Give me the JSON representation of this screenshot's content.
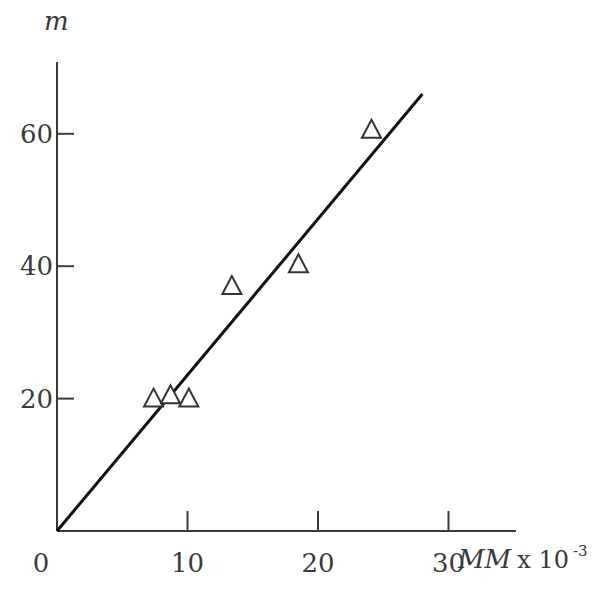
{
  "chart_data": {
    "type": "scatter",
    "title": "",
    "xlabel": "MM x 10^-3",
    "xlabel_main": "MM",
    "xlabel_suffix": "x 10",
    "xlabel_exp": "-3",
    "ylabel": "m",
    "xlim": [
      0,
      35
    ],
    "ylim": [
      0,
      70
    ],
    "x_ticks": [
      0,
      10,
      20,
      30
    ],
    "x_tick_labels": [
      "0",
      "10",
      "20",
      "30"
    ],
    "y_ticks": [
      20,
      40,
      60
    ],
    "y_tick_labels": [
      "20",
      "40",
      "60"
    ],
    "grid": false,
    "legend": null,
    "marker": "open-triangle",
    "series": [
      {
        "name": "data",
        "points": [
          {
            "x": 7.4,
            "y": 20
          },
          {
            "x": 8.7,
            "y": 20.5
          },
          {
            "x": 10.1,
            "y": 20
          },
          {
            "x": 13.4,
            "y": 37
          },
          {
            "x": 18.5,
            "y": 40.3
          },
          {
            "x": 24.1,
            "y": 60.6
          }
        ]
      }
    ],
    "fit_line": {
      "x0": 0,
      "y0": 0,
      "x1": 28,
      "y1": 66
    }
  }
}
